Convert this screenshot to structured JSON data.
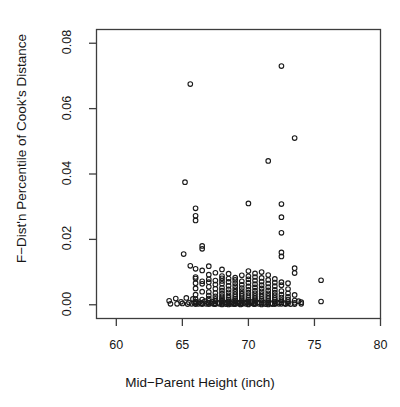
{
  "chart_data": {
    "type": "scatter",
    "title": "",
    "xlabel": "Mid−Parent Height (inch)",
    "ylabel": "F−Dist'n Percentile of Cook's Distance",
    "xlim": [
      58.5,
      80.0
    ],
    "ylim": [
      -0.0042,
      0.0842
    ],
    "xticks": [
      60,
      65,
      70,
      75,
      80
    ],
    "xtick_labels": [
      "60",
      "65",
      "70",
      "75",
      "80"
    ],
    "yticks": [
      0.0,
      0.02,
      0.04,
      0.06,
      0.08
    ],
    "ytick_labels": [
      "0.00",
      "0.02",
      "0.04",
      "0.06",
      "0.08"
    ],
    "grid": false,
    "legend": null,
    "marker": {
      "shape": "open-circle",
      "radius_px": 2.3,
      "stroke": "#1a1a1a",
      "stroke_width": 1.1,
      "fill": "none"
    },
    "point_count": 246,
    "points": [
      [
        64.0,
        0.0012
      ],
      [
        64.1,
        0.0003
      ],
      [
        64.5,
        0.0019
      ],
      [
        64.6,
        0.0003
      ],
      [
        64.9,
        0.0009
      ],
      [
        65.0,
        0.0004
      ],
      [
        65.1,
        0.0155
      ],
      [
        65.2,
        0.0375
      ],
      [
        65.3,
        0.0021
      ],
      [
        65.4,
        0.0002
      ],
      [
        65.5,
        0.0007
      ],
      [
        65.6,
        0.0675
      ],
      [
        65.6,
        0.0119
      ],
      [
        65.7,
        0.0003
      ],
      [
        65.8,
        0.0018
      ],
      [
        65.9,
        0.0006
      ],
      [
        66.0,
        0.0295
      ],
      [
        66.0,
        0.0272
      ],
      [
        66.0,
        0.0258
      ],
      [
        66.0,
        0.011
      ],
      [
        66.0,
        0.0085
      ],
      [
        66.0,
        0.008
      ],
      [
        66.0,
        0.0066
      ],
      [
        66.0,
        0.005
      ],
      [
        66.0,
        0.0031
      ],
      [
        66.0,
        0.0017
      ],
      [
        66.0,
        0.001
      ],
      [
        66.0,
        0.0006
      ],
      [
        66.0,
        0.0002
      ],
      [
        66.2,
        0.0003
      ],
      [
        66.3,
        0.0008
      ],
      [
        66.4,
        0.0004
      ],
      [
        66.5,
        0.018
      ],
      [
        66.5,
        0.0171
      ],
      [
        66.5,
        0.0105
      ],
      [
        66.5,
        0.0072
      ],
      [
        66.5,
        0.0064
      ],
      [
        66.5,
        0.004
      ],
      [
        66.5,
        0.0016
      ],
      [
        66.5,
        0.0005
      ],
      [
        66.5,
        0.0002
      ],
      [
        66.7,
        0.0011
      ],
      [
        66.8,
        0.0003
      ],
      [
        66.9,
        0.0007
      ],
      [
        67.0,
        0.0118
      ],
      [
        67.0,
        0.0092
      ],
      [
        67.0,
        0.0078
      ],
      [
        67.0,
        0.0069
      ],
      [
        67.0,
        0.0055
      ],
      [
        67.0,
        0.0039
      ],
      [
        67.0,
        0.0028
      ],
      [
        67.0,
        0.0019
      ],
      [
        67.0,
        0.0012
      ],
      [
        67.0,
        0.0006
      ],
      [
        67.0,
        0.0002
      ],
      [
        67.2,
        0.0004
      ],
      [
        67.3,
        0.0009
      ],
      [
        67.4,
        0.0002
      ],
      [
        67.5,
        0.0098
      ],
      [
        67.5,
        0.0074
      ],
      [
        67.5,
        0.0062
      ],
      [
        67.5,
        0.0049
      ],
      [
        67.5,
        0.0036
      ],
      [
        67.5,
        0.0026
      ],
      [
        67.5,
        0.0018
      ],
      [
        67.5,
        0.0011
      ],
      [
        67.5,
        0.0005
      ],
      [
        67.5,
        0.0002
      ],
      [
        67.7,
        0.0006
      ],
      [
        67.8,
        0.0003
      ],
      [
        68.0,
        0.0108
      ],
      [
        68.0,
        0.0088
      ],
      [
        68.0,
        0.0081
      ],
      [
        68.0,
        0.0073
      ],
      [
        68.0,
        0.0064
      ],
      [
        68.0,
        0.0052
      ],
      [
        68.0,
        0.0043
      ],
      [
        68.0,
        0.0034
      ],
      [
        68.0,
        0.0026
      ],
      [
        68.0,
        0.002
      ],
      [
        68.0,
        0.0015
      ],
      [
        68.0,
        0.001
      ],
      [
        68.0,
        0.0006
      ],
      [
        68.0,
        0.0003
      ],
      [
        68.0,
        0.0001
      ],
      [
        68.2,
        0.0007
      ],
      [
        68.3,
        0.0002
      ],
      [
        68.4,
        0.0005
      ],
      [
        68.5,
        0.0095
      ],
      [
        68.5,
        0.008
      ],
      [
        68.5,
        0.007
      ],
      [
        68.5,
        0.0058
      ],
      [
        68.5,
        0.0047
      ],
      [
        68.5,
        0.0038
      ],
      [
        68.5,
        0.0029
      ],
      [
        68.5,
        0.0022
      ],
      [
        68.5,
        0.0016
      ],
      [
        68.5,
        0.0011
      ],
      [
        68.5,
        0.0007
      ],
      [
        68.5,
        0.0004
      ],
      [
        68.5,
        0.0001
      ],
      [
        68.7,
        0.0003
      ],
      [
        68.8,
        0.0008
      ],
      [
        68.9,
        0.0002
      ],
      [
        69.0,
        0.0083
      ],
      [
        69.0,
        0.0076
      ],
      [
        69.0,
        0.0066
      ],
      [
        69.0,
        0.0057
      ],
      [
        69.0,
        0.0048
      ],
      [
        69.0,
        0.004
      ],
      [
        69.0,
        0.0032
      ],
      [
        69.0,
        0.0025
      ],
      [
        69.0,
        0.0019
      ],
      [
        69.0,
        0.0014
      ],
      [
        69.0,
        0.0009
      ],
      [
        69.0,
        0.0005
      ],
      [
        69.0,
        0.0002
      ],
      [
        69.2,
        0.0004
      ],
      [
        69.3,
        0.0007
      ],
      [
        69.4,
        0.0001
      ],
      [
        69.5,
        0.009
      ],
      [
        69.5,
        0.0072
      ],
      [
        69.5,
        0.0061
      ],
      [
        69.5,
        0.0051
      ],
      [
        69.5,
        0.0042
      ],
      [
        69.5,
        0.0034
      ],
      [
        69.5,
        0.0027
      ],
      [
        69.5,
        0.002
      ],
      [
        69.5,
        0.0014
      ],
      [
        69.5,
        0.0009
      ],
      [
        69.5,
        0.0005
      ],
      [
        69.5,
        0.0002
      ],
      [
        69.7,
        0.0006
      ],
      [
        69.8,
        0.0003
      ],
      [
        69.9,
        0.0008
      ],
      [
        70.0,
        0.031
      ],
      [
        70.0,
        0.0103
      ],
      [
        70.0,
        0.0087
      ],
      [
        70.0,
        0.0078
      ],
      [
        70.0,
        0.0067
      ],
      [
        70.0,
        0.0056
      ],
      [
        70.0,
        0.0046
      ],
      [
        70.0,
        0.0037
      ],
      [
        70.0,
        0.0029
      ],
      [
        70.0,
        0.0022
      ],
      [
        70.0,
        0.0016
      ],
      [
        70.0,
        0.0011
      ],
      [
        70.0,
        0.0007
      ],
      [
        70.0,
        0.0003
      ],
      [
        70.0,
        0.0001
      ],
      [
        70.2,
        0.0005
      ],
      [
        70.3,
        0.0009
      ],
      [
        70.4,
        0.0002
      ],
      [
        70.5,
        0.0096
      ],
      [
        70.5,
        0.0085
      ],
      [
        70.5,
        0.0074
      ],
      [
        70.5,
        0.0063
      ],
      [
        70.5,
        0.0053
      ],
      [
        70.5,
        0.0043
      ],
      [
        70.5,
        0.0035
      ],
      [
        70.5,
        0.0027
      ],
      [
        70.5,
        0.002
      ],
      [
        70.5,
        0.0014
      ],
      [
        70.5,
        0.0009
      ],
      [
        70.5,
        0.0005
      ],
      [
        70.5,
        0.0002
      ],
      [
        70.7,
        0.0007
      ],
      [
        70.8,
        0.0003
      ],
      [
        71.0,
        0.01
      ],
      [
        71.0,
        0.0082
      ],
      [
        71.0,
        0.0071
      ],
      [
        71.0,
        0.006
      ],
      [
        71.0,
        0.005
      ],
      [
        71.0,
        0.0041
      ],
      [
        71.0,
        0.0033
      ],
      [
        71.0,
        0.0025
      ],
      [
        71.0,
        0.0018
      ],
      [
        71.0,
        0.0013
      ],
      [
        71.0,
        0.0008
      ],
      [
        71.0,
        0.0004
      ],
      [
        71.0,
        0.0001
      ],
      [
        71.2,
        0.0006
      ],
      [
        71.3,
        0.0002
      ],
      [
        71.5,
        0.044
      ],
      [
        71.5,
        0.0091
      ],
      [
        71.5,
        0.0076
      ],
      [
        71.5,
        0.0065
      ],
      [
        71.5,
        0.0054
      ],
      [
        71.5,
        0.0044
      ],
      [
        71.5,
        0.0035
      ],
      [
        71.5,
        0.0027
      ],
      [
        71.5,
        0.002
      ],
      [
        71.5,
        0.0013
      ],
      [
        71.5,
        0.0008
      ],
      [
        71.5,
        0.0004
      ],
      [
        71.5,
        0.0001
      ],
      [
        71.7,
        0.0005
      ],
      [
        71.8,
        0.0002
      ],
      [
        72.0,
        0.0079
      ],
      [
        72.0,
        0.0068
      ],
      [
        72.0,
        0.0057
      ],
      [
        72.0,
        0.0046
      ],
      [
        72.0,
        0.0037
      ],
      [
        72.0,
        0.0029
      ],
      [
        72.0,
        0.0021
      ],
      [
        72.0,
        0.0015
      ],
      [
        72.0,
        0.001
      ],
      [
        72.0,
        0.0005
      ],
      [
        72.0,
        0.0002
      ],
      [
        72.2,
        0.0007
      ],
      [
        72.3,
        0.0003
      ],
      [
        72.5,
        0.073
      ],
      [
        72.5,
        0.0308
      ],
      [
        72.5,
        0.0268
      ],
      [
        72.5,
        0.022
      ],
      [
        72.5,
        0.016
      ],
      [
        72.5,
        0.0148
      ],
      [
        72.5,
        0.0069
      ],
      [
        72.5,
        0.006
      ],
      [
        72.5,
        0.0042
      ],
      [
        72.5,
        0.0031
      ],
      [
        72.5,
        0.0022
      ],
      [
        72.5,
        0.0014
      ],
      [
        72.5,
        0.0008
      ],
      [
        72.5,
        0.0003
      ],
      [
        72.7,
        0.0005
      ],
      [
        72.8,
        0.0002
      ],
      [
        73.0,
        0.0066
      ],
      [
        73.0,
        0.0048
      ],
      [
        73.0,
        0.0035
      ],
      [
        73.0,
        0.0024
      ],
      [
        73.0,
        0.0016
      ],
      [
        73.0,
        0.0009
      ],
      [
        73.0,
        0.0004
      ],
      [
        73.2,
        0.0002
      ],
      [
        73.5,
        0.051
      ],
      [
        73.5,
        0.0112
      ],
      [
        73.5,
        0.0097
      ],
      [
        73.5,
        0.003
      ],
      [
        73.5,
        0.0013
      ],
      [
        73.5,
        0.0006
      ],
      [
        73.5,
        0.0002
      ],
      [
        73.8,
        0.0011
      ],
      [
        74.0,
        0.0008
      ],
      [
        74.0,
        0.0003
      ],
      [
        75.5,
        0.0075
      ],
      [
        75.5,
        0.001
      ]
    ]
  },
  "axes": {
    "x_title": "Mid−Parent Height (inch)",
    "y_title": "F−Dist'n Percentile of Cook's Distance",
    "x_tick_labels": [
      "60",
      "65",
      "70",
      "75",
      "80"
    ],
    "y_tick_labels": [
      "0.00",
      "0.02",
      "0.04",
      "0.06",
      "0.08"
    ]
  },
  "style": {
    "frame_color": "#3d3d3d",
    "tick_color": "#3d3d3d",
    "text_color": "#161616",
    "marker_color": "#1a1a1a",
    "background": "#ffffff"
  }
}
